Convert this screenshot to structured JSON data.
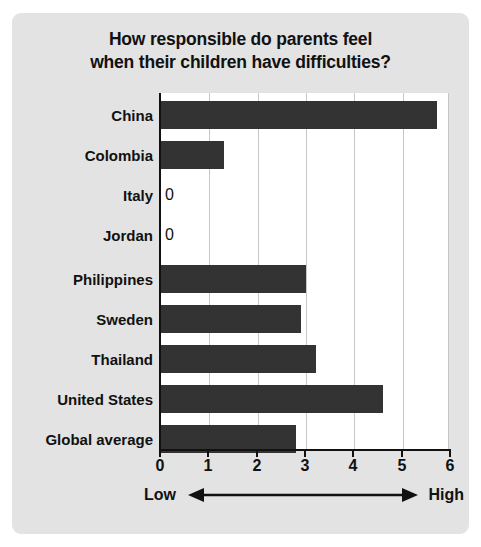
{
  "chart_data": {
    "type": "bar",
    "orientation": "horizontal",
    "title": "How responsible do parents feel when their children have difficulties?",
    "title_lines": [
      "How responsible do parents feel",
      "when their children have difficulties?"
    ],
    "categories": [
      "China",
      "Colombia",
      "Italy",
      "Jordan",
      "Philippines",
      "Sweden",
      "Thailand",
      "United States",
      "Global average"
    ],
    "values": [
      5.7,
      1.3,
      0,
      0,
      3.0,
      2.9,
      3.2,
      4.6,
      2.8
    ],
    "point_labels": [
      "",
      "",
      "0",
      "0",
      "",
      "",
      "",
      "",
      ""
    ],
    "xlabel": "",
    "ylabel": "",
    "xlim": [
      0,
      6
    ],
    "xticks": [
      0,
      1,
      2,
      3,
      4,
      5,
      6
    ],
    "xtick_labels": [
      "0",
      "1",
      "2",
      "3",
      "4",
      "5",
      "6"
    ],
    "grid": "vertical",
    "legend": "none",
    "annotations": {
      "low_label": "Low",
      "high_label": "High",
      "arrow": "double-headed-horizontal-arrow"
    },
    "colors": {
      "bar": "#333333",
      "panel_background": "#e3e3e3",
      "plot_background": "#ffffff",
      "gridline": "#c6c6c6",
      "axis": "#111111",
      "text": "#111111"
    }
  }
}
